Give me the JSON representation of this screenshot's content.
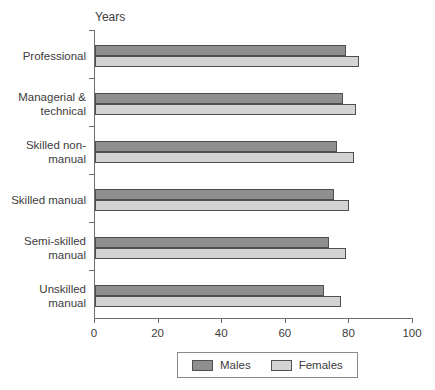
{
  "chart_data": {
    "type": "bar",
    "orientation": "horizontal",
    "axis_top_label": "Years",
    "categories": [
      {
        "id": "professional",
        "lines": [
          "Professional"
        ]
      },
      {
        "id": "managerial-technical",
        "lines": [
          "Managerial &",
          "technical"
        ]
      },
      {
        "id": "skilled-non-manual",
        "lines": [
          "Skilled non-",
          "manual"
        ]
      },
      {
        "id": "skilled-manual",
        "lines": [
          "Skilled manual"
        ]
      },
      {
        "id": "semi-skilled-manual",
        "lines": [
          "Semi-skilled",
          "manual"
        ]
      },
      {
        "id": "unskilled-manual",
        "lines": [
          "Unskilled",
          "manual"
        ]
      }
    ],
    "series": [
      {
        "name": "Males",
        "color": "#8f8f8f",
        "values": [
          79,
          78,
          76,
          75,
          73.5,
          72
        ]
      },
      {
        "name": "Females",
        "color": "#d4d4d4",
        "values": [
          83,
          82,
          81.5,
          80,
          79,
          77.5
        ]
      }
    ],
    "xlim": [
      0,
      100
    ],
    "xticks": [
      0,
      20,
      40,
      60,
      80,
      100
    ],
    "legend_position": "bottom",
    "colors": {
      "bar_border": "#4f4f4f",
      "axis": "#6e6e6e",
      "text": "#3c3c3c",
      "background": "#ffffff"
    }
  }
}
